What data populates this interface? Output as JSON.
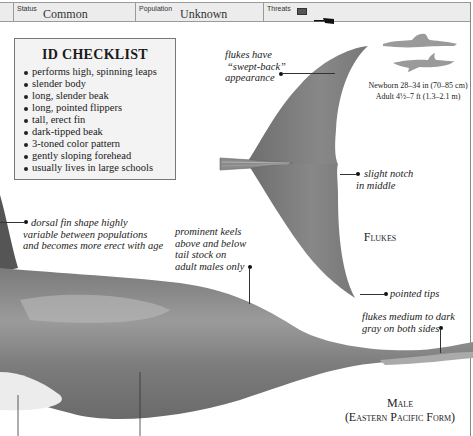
{
  "header": {
    "status": {
      "label": "Status",
      "value": "Common"
    },
    "population": {
      "label": "Population",
      "value": "Unknown"
    },
    "threats": {
      "label": "Threats",
      "icons": [
        "net-icon",
        "harpoon-icon"
      ]
    }
  },
  "checklist": {
    "title": "ID CHECKLIST",
    "items": [
      "performs high, spinning leaps",
      "slender body",
      "long, slender beak",
      "long, pointed flippers",
      "tall, erect fin",
      "dark-tipped beak",
      "3-toned color pattern",
      "gently sloping forehead",
      "usually lives in large schools"
    ]
  },
  "annotations": {
    "swept_back": [
      "flukes have",
      "“swept-back”",
      "appearance"
    ],
    "slight_notch": [
      "slight notch",
      "in middle"
    ],
    "dorsal_fin": [
      "dorsal fin shape highly",
      "variable between populations",
      "and becomes more erect with age"
    ],
    "keels": [
      "prominent keels",
      "above and below",
      "tail stock on",
      "adult males only"
    ],
    "pointed_tips": "pointed tips",
    "flukes_color": [
      "flukes medium to dark",
      "gray on both sides"
    ]
  },
  "size": {
    "newborn": "Newborn 28–34 in (70–85 cm)",
    "adult": "Adult 4½–7 ft (1.3–2.1 m)",
    "icons": [
      "human-swimmer-silhouette-icon",
      "dolphin-silhouette-icon"
    ]
  },
  "labels": {
    "flukes": "Flukes",
    "male": "Male",
    "form": "(Eastern Pacific Form)"
  },
  "colors": {
    "header_bg": "#ececec",
    "checklist_bg": "#f3f3f3",
    "dolphin_gray": "#7d7d7d",
    "silhouette_gray": "#9a9a9a"
  }
}
